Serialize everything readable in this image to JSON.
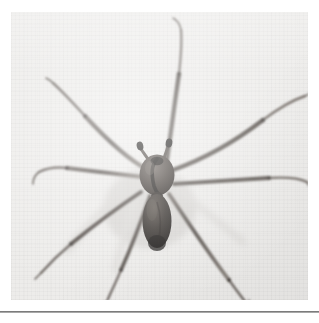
{
  "page": {
    "background_color": "#ffffff",
    "rule_color": "#6d6d6d"
  },
  "photo": {
    "caption": "",
    "background_color": "#edecea",
    "subject": "brown recluse spider",
    "body_color": "#4a4440",
    "abdomen_color": "#2e2a27",
    "leg_color": "#57514c",
    "shadow_color": "#cfcdca",
    "frame": {
      "x": 11,
      "y": 12,
      "width": 297,
      "height": 288
    }
  },
  "spider": {
    "cephalothorax": {
      "cx": 146,
      "cy": 164,
      "rx": 17,
      "ry": 20
    },
    "abdomen": {
      "cx": 146,
      "cy": 208,
      "rx": 14,
      "ry": 27
    },
    "palps": [
      {
        "name": "left-palp",
        "tip_x": 131,
        "tip_y": 136
      },
      {
        "name": "right-palp",
        "tip_x": 151,
        "tip_y": 134
      }
    ],
    "legs": [
      {
        "name": "leg-front-left",
        "tip_x": 42,
        "tip_y": 71
      },
      {
        "name": "leg-front-right",
        "tip_x": 172,
        "tip_y": 18
      },
      {
        "name": "leg-mid-left",
        "tip_x": 22,
        "tip_y": 172
      },
      {
        "name": "leg-mid-right",
        "tip_x": 296,
        "tip_y": 86
      },
      {
        "name": "leg-rear-left",
        "tip_x": 28,
        "tip_y": 264
      },
      {
        "name": "leg-rear-right",
        "tip_x": 300,
        "tip_y": 171
      },
      {
        "name": "leg-hind-left",
        "tip_x": 97,
        "tip_y": 290
      },
      {
        "name": "leg-hind-right",
        "tip_x": 238,
        "tip_y": 296
      }
    ]
  }
}
